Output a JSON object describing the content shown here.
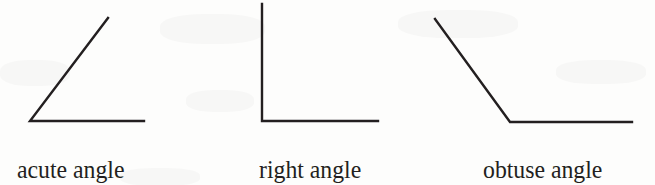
{
  "figure": {
    "background_color": "#fdfdfc",
    "stroke_color": "#231f20",
    "items": [
      {
        "id": "acute",
        "label": "acute angle",
        "icon_name": "acute-angle-icon",
        "vertex": [
          30,
          121
        ],
        "ray_end_1": [
          108,
          18
        ],
        "ray_end_2": [
          144,
          121
        ],
        "path": "M 108 18 L 30 121 L 144 121"
      },
      {
        "id": "right",
        "label": "right angle",
        "icon_name": "right-angle-icon",
        "vertex": [
          262,
          121
        ],
        "ray_end_1": [
          262,
          4
        ],
        "ray_end_2": [
          378,
          121
        ],
        "path": "M 262 4 L 262 121 L 378 121"
      },
      {
        "id": "obtuse",
        "label": "obtuse angle",
        "icon_name": "obtuse-angle-icon",
        "vertex": [
          510,
          122
        ],
        "ray_end_1": [
          435,
          19
        ],
        "ray_end_2": [
          632,
          122
        ],
        "path": "M 435 19 L 510 122 L 632 122"
      }
    ]
  },
  "captions": {
    "acute": "acute angle",
    "right": "right angle",
    "obtuse": "obtuse angle"
  }
}
